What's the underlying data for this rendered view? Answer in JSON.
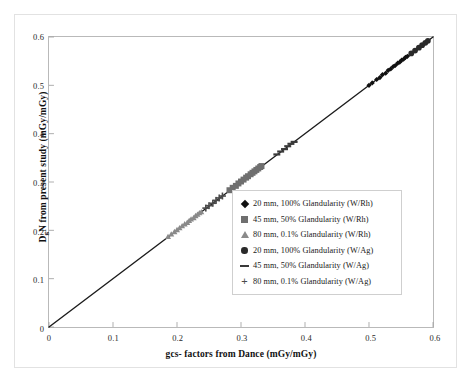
{
  "chart_data": {
    "type": "scatter",
    "title": "",
    "xlabel": "gcs- factors from Dance (mGy/mGy)",
    "ylabel_html": "D<sub>g</sub>N from present study (mGy/mGy)",
    "ylabel_text": "DgN from present study (mGy/mGy)",
    "ylabel_main": "N from present study (mGy/mGy)",
    "ylabel_lead": "D",
    "ylabel_sub": "g",
    "xlim": [
      0,
      0.6
    ],
    "ylim": [
      0,
      0.6
    ],
    "xticks": [
      "0",
      "0.1",
      "0.2",
      "0.3",
      "0.4",
      "0.5",
      "0.6"
    ],
    "xtick_values": [
      0,
      0.1,
      0.2,
      0.3,
      0.4,
      0.5,
      0.6
    ],
    "yticks": [
      "0",
      "0.1",
      "0.2",
      "0.3",
      "0.4",
      "0.5",
      "0.6"
    ],
    "ytick_values": [
      0,
      0.1,
      0.2,
      0.3,
      0.4,
      0.5,
      0.6
    ],
    "grid": false,
    "legend_position": "center-right-inside",
    "identity_line": {
      "label": "y = x",
      "from": [
        0,
        0
      ],
      "to": [
        0.6,
        0.6
      ],
      "color": "#1c1c1c",
      "width": 1.4
    },
    "series": [
      {
        "name": "20 mm, 100% Glandularity (W/Rh)",
        "marker": "diamond",
        "color": "#111111",
        "size": 5.2,
        "points": [
          [
            0.5,
            0.5
          ],
          [
            0.505,
            0.505
          ],
          [
            0.512,
            0.512
          ],
          [
            0.517,
            0.516
          ],
          [
            0.521,
            0.522
          ],
          [
            0.526,
            0.525
          ],
          [
            0.53,
            0.531
          ],
          [
            0.534,
            0.534
          ],
          [
            0.538,
            0.539
          ],
          [
            0.541,
            0.541
          ],
          [
            0.545,
            0.546
          ],
          [
            0.548,
            0.548
          ],
          [
            0.551,
            0.552
          ],
          [
            0.554,
            0.554
          ],
          [
            0.557,
            0.558
          ],
          [
            0.56,
            0.56
          ]
        ]
      },
      {
        "name": "45 mm, 50% Glandularity (W/Rh)",
        "marker": "square",
        "color": "#6f6f6f",
        "size": 6.0,
        "points": [
          [
            0.282,
            0.283
          ],
          [
            0.287,
            0.288
          ],
          [
            0.292,
            0.292
          ],
          [
            0.296,
            0.297
          ],
          [
            0.3,
            0.301
          ],
          [
            0.304,
            0.305
          ],
          [
            0.308,
            0.309
          ],
          [
            0.311,
            0.312
          ],
          [
            0.315,
            0.316
          ],
          [
            0.318,
            0.319
          ],
          [
            0.321,
            0.322
          ],
          [
            0.324,
            0.325
          ],
          [
            0.327,
            0.328
          ],
          [
            0.33,
            0.331
          ],
          [
            0.332,
            0.333
          ]
        ]
      },
      {
        "name": "80 mm, 0.1% Glandularity (W/Rh)",
        "marker": "triangle",
        "color": "#8a8a8a",
        "size": 6.0,
        "points": [
          [
            0.186,
            0.187
          ],
          [
            0.191,
            0.192
          ],
          [
            0.196,
            0.197
          ],
          [
            0.2,
            0.201
          ],
          [
            0.204,
            0.205
          ],
          [
            0.208,
            0.209
          ],
          [
            0.212,
            0.213
          ],
          [
            0.216,
            0.216
          ],
          [
            0.219,
            0.22
          ],
          [
            0.222,
            0.223
          ],
          [
            0.226,
            0.226
          ],
          [
            0.229,
            0.23
          ],
          [
            0.232,
            0.233
          ],
          [
            0.235,
            0.236
          ],
          [
            0.238,
            0.238
          ]
        ]
      },
      {
        "name": "20 mm, 100% Glandularity (W/Ag)",
        "marker": "circle",
        "color": "#2a2a2a",
        "size": 5.8,
        "points": [
          [
            0.566,
            0.566
          ],
          [
            0.572,
            0.572
          ],
          [
            0.578,
            0.578
          ],
          [
            0.583,
            0.583
          ],
          [
            0.588,
            0.588
          ],
          [
            0.592,
            0.592
          ]
        ]
      },
      {
        "name": "45 mm, 50% Glandularity (W/Ag)",
        "marker": "dash",
        "color": "#3a3a3a",
        "size": 7.0,
        "points": [
          [
            0.356,
            0.357
          ],
          [
            0.362,
            0.363
          ],
          [
            0.368,
            0.368
          ],
          [
            0.373,
            0.374
          ],
          [
            0.378,
            0.379
          ],
          [
            0.383,
            0.383
          ]
        ]
      },
      {
        "name": "80 mm, 0.1% Glandularity (W/Ag)",
        "marker": "plus",
        "color": "#4a4a4a",
        "size": 7.0,
        "points": [
          [
            0.245,
            0.246
          ],
          [
            0.25,
            0.251
          ],
          [
            0.256,
            0.256
          ],
          [
            0.261,
            0.262
          ],
          [
            0.266,
            0.267
          ],
          [
            0.271,
            0.271
          ]
        ]
      }
    ]
  },
  "legend": {
    "items": [
      {
        "label": "20 mm, 100% Glandularity (W/Rh)",
        "marker": "diamond",
        "color": "#111111"
      },
      {
        "label": "45 mm, 50% Glandularity (W/Rh)",
        "marker": "square",
        "color": "#6f6f6f"
      },
      {
        "label": "80 mm, 0.1% Glandularity (W/Rh)",
        "marker": "triangle",
        "color": "#8a8a8a"
      },
      {
        "label": "20 mm, 100% Glandularity (W/Ag)",
        "marker": "circle",
        "color": "#2a2a2a"
      },
      {
        "label": "45 mm, 50% Glandularity (W/Ag)",
        "marker": "dash",
        "color": "#3a3a3a"
      },
      {
        "label": "80 mm, 0.1% Glandularity (W/Ag)",
        "marker": "plus",
        "color": "#4a4a4a"
      }
    ]
  }
}
